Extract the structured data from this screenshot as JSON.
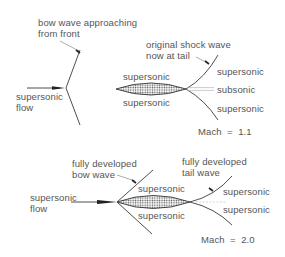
{
  "diagram": {
    "colors": {
      "line": "#3a3a3a",
      "text": "#555555",
      "wake": "#aaaaaa",
      "fill_dots": "#555555"
    },
    "panel_top": {
      "bow_wave_label_line1": "bow wave approaching",
      "bow_wave_label_line2": "from front",
      "flow_label_line1": "supersonic",
      "flow_label_line2": "flow",
      "body_above": "supersonic",
      "body_below": "supersonic",
      "tail_label_line1": "original shock wave",
      "tail_label_line2": "now at tail",
      "region_upper": "supersonic",
      "region_wake": "subsonic",
      "region_lower": "supersonic",
      "mach": "Mach  =  1.1"
    },
    "panel_bottom": {
      "bow_label_line1": "fully developed",
      "bow_label_line2": "bow wave",
      "flow_label_line1": "supersonic",
      "flow_label_line2": "flow",
      "body_above": "supersonic",
      "body_below": "supersonic",
      "tail_label_line1": "fully developed",
      "tail_label_line2": "tail wave",
      "region_upper": "supersonic",
      "region_lower": "supersonic",
      "mach": "Mach  =  2.0"
    }
  }
}
